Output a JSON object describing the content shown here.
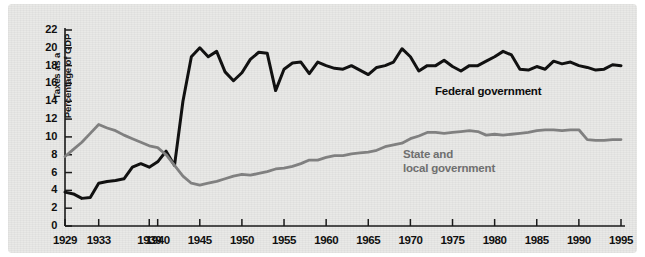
{
  "chart_data": {
    "type": "line",
    "title": "",
    "subtitle": "",
    "xlabel": "",
    "ylabel": "Taxes as a Percentage of GDP",
    "xlim": [
      1929,
      1995
    ],
    "ylim": [
      0,
      22
    ],
    "grid": false,
    "legend_position": "inline-annotation",
    "ytick_labels": [
      "0",
      "2",
      "4",
      "6",
      "8",
      "10",
      "12",
      "14",
      "16",
      "18",
      "20",
      "22"
    ],
    "ytick_values": [
      0,
      2,
      4,
      6,
      8,
      10,
      12,
      14,
      16,
      18,
      20,
      22
    ],
    "xtick_labels": [
      "1929",
      "1933",
      "1939",
      "1940",
      "1945",
      "1950",
      "1955",
      "1960",
      "1965",
      "1970",
      "1975",
      "1980",
      "1985",
      "1990",
      "1995"
    ],
    "xtick_values": [
      1929,
      1933,
      1939,
      1940,
      1945,
      1950,
      1955,
      1960,
      1965,
      1970,
      1975,
      1980,
      1985,
      1990,
      1995
    ],
    "x": [
      1929,
      1930,
      1931,
      1932,
      1933,
      1934,
      1935,
      1936,
      1937,
      1938,
      1939,
      1940,
      1941,
      1942,
      1943,
      1944,
      1945,
      1946,
      1947,
      1948,
      1949,
      1950,
      1951,
      1952,
      1953,
      1954,
      1955,
      1956,
      1957,
      1958,
      1959,
      1960,
      1961,
      1962,
      1963,
      1964,
      1965,
      1966,
      1967,
      1968,
      1969,
      1970,
      1971,
      1972,
      1973,
      1974,
      1975,
      1976,
      1977,
      1978,
      1979,
      1980,
      1981,
      1982,
      1983,
      1984,
      1985,
      1986,
      1987,
      1988,
      1989,
      1990,
      1991,
      1992,
      1993,
      1994,
      1995
    ],
    "series": [
      {
        "name": "Federal government",
        "color": "#111111",
        "label_text": "Federal government",
        "values": [
          3.8,
          3.6,
          3.1,
          3.2,
          4.8,
          5.0,
          5.1,
          5.3,
          6.6,
          7.0,
          6.6,
          7.2,
          8.4,
          6.8,
          14.0,
          19.0,
          20.0,
          19.0,
          19.6,
          17.3,
          16.3,
          17.2,
          18.7,
          19.5,
          19.4,
          15.2,
          17.6,
          18.3,
          18.4,
          17.1,
          18.4,
          18.0,
          17.7,
          17.6,
          18.0,
          17.5,
          17.0,
          17.8,
          18.0,
          18.4,
          19.9,
          19.0,
          17.4,
          18.0,
          18.0,
          18.6,
          17.9,
          17.4,
          18.0,
          18.0,
          18.5,
          19.0,
          19.6,
          19.2,
          17.6,
          17.5,
          17.9,
          17.6,
          18.5,
          18.2,
          18.4,
          18.0,
          17.8,
          17.5,
          17.6,
          18.1,
          18.0
        ]
      },
      {
        "name": "State and local government",
        "color": "#808080",
        "label_text": "State and\nlocal government",
        "label_line1": "State and",
        "label_line2": "local government",
        "values": [
          7.8,
          8.6,
          9.4,
          10.4,
          11.4,
          11.0,
          10.7,
          10.2,
          9.8,
          9.4,
          9.0,
          8.8,
          8.0,
          6.8,
          5.6,
          4.8,
          4.6,
          4.8,
          5.0,
          5.3,
          5.6,
          5.8,
          5.7,
          5.9,
          6.1,
          6.4,
          6.5,
          6.7,
          7.0,
          7.4,
          7.4,
          7.7,
          7.9,
          7.9,
          8.1,
          8.2,
          8.3,
          8.5,
          8.9,
          9.1,
          9.3,
          9.8,
          10.1,
          10.5,
          10.5,
          10.4,
          10.5,
          10.6,
          10.7,
          10.6,
          10.2,
          10.3,
          10.2,
          10.3,
          10.4,
          10.5,
          10.7,
          10.8,
          10.8,
          10.7,
          10.8,
          10.8,
          9.7,
          9.6,
          9.6,
          9.7,
          9.7
        ]
      }
    ]
  },
  "annotations": {
    "federal_label": "Federal government",
    "state_label_line1": "State and",
    "state_label_line2": "local government"
  },
  "axis": {
    "y_title": "Taxes as a Percentage of GDP",
    "y_title_line1": "Taxes as a",
    "y_title_line2": "Percentage of GDP"
  },
  "colors": {
    "federal": "#111111",
    "state": "#808080",
    "axis": "#1a1a1a",
    "paper": "#e9e9e7"
  }
}
